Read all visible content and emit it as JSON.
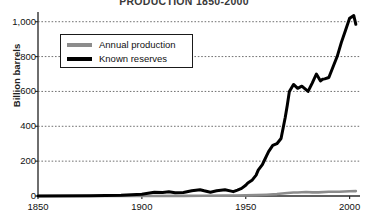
{
  "chart_data": {
    "type": "line",
    "title": "PRODUCTION 1850-2000",
    "xlabel": "",
    "ylabel": "Billion barrels",
    "xlim": [
      1850,
      2005
    ],
    "ylim": [
      0,
      1050
    ],
    "grid": true,
    "legend_position": "top-left",
    "x_ticks": [
      "1850",
      "1900",
      "1950",
      "2000"
    ],
    "x_tick_values": [
      1850,
      1900,
      1950,
      2000
    ],
    "y_ticks": [
      "0",
      "200",
      "400",
      "600",
      "800",
      "1,000"
    ],
    "y_tick_values": [
      0,
      200,
      400,
      600,
      800,
      1000
    ],
    "series": [
      {
        "name": "Annual production",
        "color": "#8c8c8c",
        "x": [
          1850,
          1900,
          1920,
          1930,
          1940,
          1945,
          1950,
          1955,
          1960,
          1965,
          1970,
          1973,
          1975,
          1979,
          1982,
          1985,
          1990,
          1995,
          2000,
          2003
        ],
        "values": [
          0,
          0,
          1,
          1.5,
          2,
          2.5,
          3.5,
          5,
          7.5,
          11,
          17,
          20,
          20,
          23,
          21,
          21,
          24,
          24,
          27,
          28
        ]
      },
      {
        "name": "Known reserves",
        "color": "#000000",
        "x": [
          1850,
          1875,
          1890,
          1895,
          1900,
          1903,
          1906,
          1910,
          1913,
          1916,
          1920,
          1924,
          1928,
          1930,
          1933,
          1936,
          1940,
          1943,
          1944,
          1946,
          1948,
          1950,
          1951,
          1953,
          1955,
          1956,
          1958,
          1959,
          1960,
          1961,
          1963,
          1965,
          1967,
          1968,
          1969,
          1970,
          1971,
          1973,
          1975,
          1977,
          1980,
          1982,
          1984,
          1986,
          1987,
          1988,
          1990,
          1992,
          1994,
          1996,
          1998,
          2000,
          2002,
          2003
        ],
        "values": [
          0,
          1,
          4,
          7,
          10,
          16,
          22,
          20,
          24,
          19,
          20,
          30,
          36,
          30,
          22,
          30,
          36,
          28,
          25,
          34,
          44,
          62,
          75,
          90,
          120,
          148,
          180,
          205,
          230,
          255,
          290,
          300,
          330,
          390,
          450,
          520,
          600,
          640,
          618,
          630,
          600,
          648,
          700,
          660,
          670,
          672,
          680,
          740,
          800,
          880,
          950,
          1020,
          1035,
          985
        ]
      }
    ]
  },
  "legend": {
    "items": [
      {
        "label": "Annual production",
        "color": "#8c8c8c"
      },
      {
        "label": "Known reserves",
        "color": "#000000"
      }
    ]
  }
}
